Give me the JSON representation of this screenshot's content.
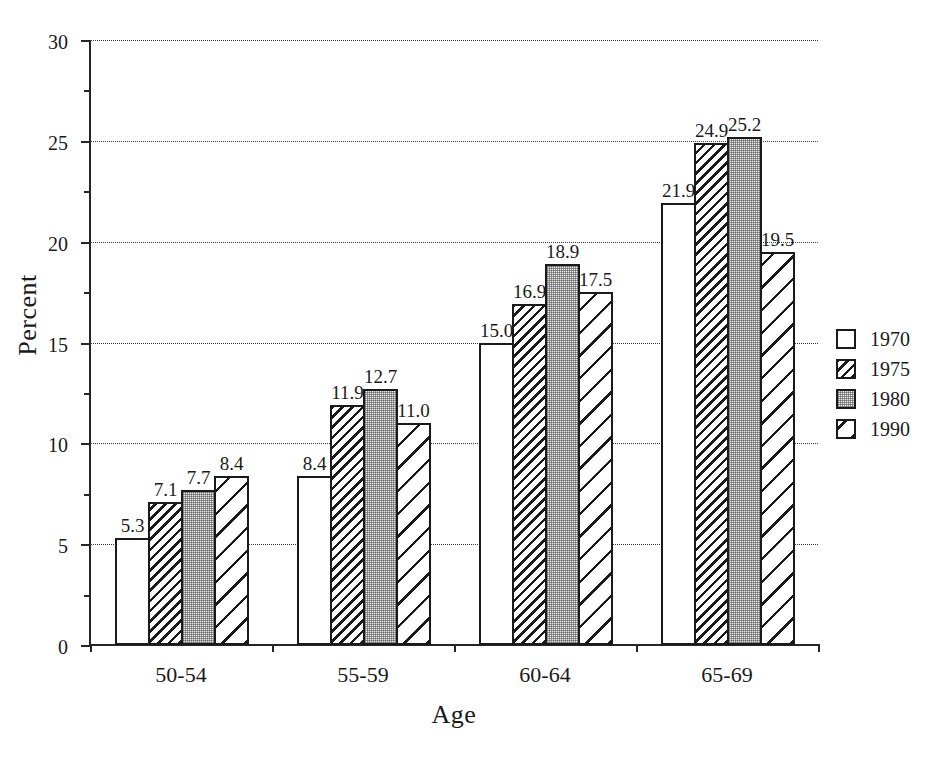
{
  "chart_data": {
    "type": "bar",
    "title": "",
    "xlabel": "Age",
    "ylabel": "Percent",
    "categories": [
      "50-54",
      "55-59",
      "60-64",
      "65-69"
    ],
    "series": [
      {
        "name": "1970",
        "pattern": "empty",
        "values": [
          5.3,
          8.4,
          15.0,
          21.9
        ]
      },
      {
        "name": "1975",
        "pattern": "hatch-dense",
        "values": [
          7.1,
          11.9,
          16.9,
          24.9
        ]
      },
      {
        "name": "1980",
        "pattern": "stipple",
        "values": [
          7.7,
          12.7,
          18.9,
          25.2
        ]
      },
      {
        "name": "1990",
        "pattern": "hatch-wide",
        "values": [
          8.4,
          11.0,
          17.5,
          19.5
        ]
      }
    ],
    "value_labels": [
      [
        "5.3",
        "7.1",
        "7.7",
        "8.4"
      ],
      [
        "8.4",
        "11.9",
        "12.7",
        "11.0"
      ],
      [
        "15.0",
        "16.9",
        "18.9",
        "17.5"
      ],
      [
        "21.9",
        "24.9",
        "25.2",
        "19.5"
      ]
    ],
    "ylim": [
      0,
      30
    ],
    "ytick_values": [
      0,
      5,
      10,
      15,
      20,
      25,
      30
    ],
    "ytick_labels": [
      "0",
      "5",
      "10",
      "15",
      "20",
      "25",
      "30"
    ],
    "yminor_values": [
      2.5,
      7.5,
      12.5,
      17.5,
      22.5,
      27.5
    ],
    "grid": true,
    "grid_axis": "y",
    "legend_position": "right",
    "legend_entries": [
      "1970",
      "1975",
      "1980",
      "1990"
    ],
    "colors": {
      "axis": "#262626",
      "bar_outline": "#1a1a1a",
      "bar_fill": "#ffffff",
      "stipple_fill": "#e9e9e9",
      "grid": "#3a3a3a",
      "background": "#ffffff",
      "text": "#1a1a1a"
    }
  }
}
